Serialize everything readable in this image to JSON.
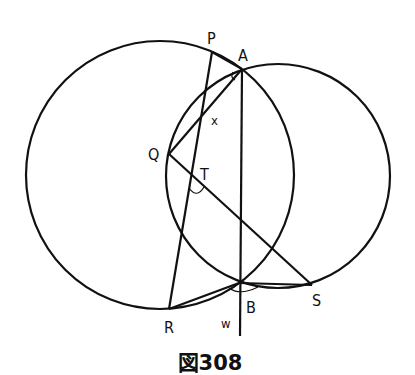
{
  "figure": {
    "caption": "図308",
    "circles": [
      {
        "name": "large-left-circle",
        "cx": 160,
        "cy": 175,
        "r": 134
      },
      {
        "name": "right-circle",
        "cx": 278,
        "cy": 176,
        "r": 112
      }
    ],
    "points": {
      "P": {
        "label": "P",
        "x": 212,
        "y": 52
      },
      "A": {
        "label": "A",
        "x": 242,
        "y": 69
      },
      "Q": {
        "label": "Q",
        "x": 169,
        "y": 154
      },
      "T": {
        "label": "T",
        "x": 191,
        "y": 174
      },
      "R": {
        "label": "R",
        "x": 169,
        "y": 309
      },
      "B": {
        "label": "B",
        "x": 239,
        "y": 283
      },
      "S": {
        "label": "S",
        "x": 312,
        "y": 285
      }
    },
    "angle_labels": {
      "x": "x",
      "w": "w"
    },
    "segments": [
      "PR",
      "PA",
      "QA",
      "QS",
      "AW",
      "RB",
      "BS"
    ]
  }
}
